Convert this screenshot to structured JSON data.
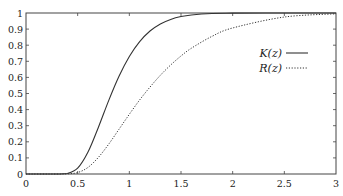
{
  "chart_data": {
    "type": "line",
    "title": "",
    "xlabel": "",
    "ylabel": "",
    "xlim": [
      0,
      3
    ],
    "ylim": [
      0,
      1
    ],
    "grid": false,
    "legend_position": "upper right (inside)",
    "x_ticks": [
      "0",
      "0.5",
      "1",
      "1.5",
      "2",
      "2.5",
      "3"
    ],
    "y_ticks": [
      "0",
      "0.1",
      "0.2",
      "0.3",
      "0.4",
      "0.5",
      "0.6",
      "0.7",
      "0.8",
      "0.9",
      "1"
    ],
    "x": [
      0,
      0.3,
      0.4,
      0.5,
      0.6,
      0.7,
      0.8,
      0.9,
      1.0,
      1.1,
      1.2,
      1.3,
      1.4,
      1.5,
      1.6,
      1.8,
      2.0,
      2.5,
      3.0
    ],
    "series": [
      {
        "name": "K(z)",
        "style": "solid",
        "color": "#333333",
        "values": [
          0,
          0,
          0.003,
          0.036,
          0.136,
          0.289,
          0.456,
          0.607,
          0.73,
          0.822,
          0.888,
          0.932,
          0.96,
          0.978,
          0.988,
          0.997,
          0.999,
          1.0,
          1.0
        ]
      },
      {
        "name": "R(z)",
        "style": "dotted",
        "color": "#333333",
        "values": [
          0,
          0,
          0.001,
          0.009,
          0.041,
          0.103,
          0.185,
          0.278,
          0.371,
          0.46,
          0.54,
          0.613,
          0.677,
          0.733,
          0.781,
          0.855,
          0.907,
          0.975,
          0.995
        ]
      }
    ]
  },
  "legend": {
    "items": [
      {
        "label": "K(z)",
        "style": "solid"
      },
      {
        "label": "R(z)",
        "style": "dotted"
      }
    ]
  }
}
